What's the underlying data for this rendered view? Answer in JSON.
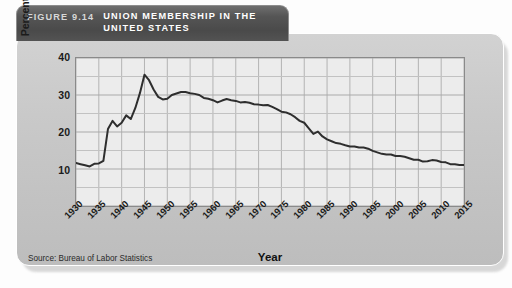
{
  "figure": {
    "number_label": "FIGURE 9.14",
    "title": "UNION MEMBERSHIP IN THE\nUNITED STATES",
    "source_note": "Source: Bureau of Labor Statistics"
  },
  "colors": {
    "panel": "#c9c9c9",
    "title_tab": "#4a4a4a",
    "title_text": "#ffffff",
    "plot_bg": "#ececec",
    "grid": "#b0b0b0",
    "line": "#2e2e2e",
    "axis": "#8a8a8a"
  },
  "chart_data": {
    "type": "line",
    "title": "UNION MEMBERSHIP IN THE UNITED STATES",
    "xlabel": "Year",
    "ylabel": "Percent of labor force",
    "xlim": [
      1930,
      2015
    ],
    "ylim": [
      0,
      40
    ],
    "yticks": [
      10,
      20,
      30,
      40
    ],
    "xticks": [
      1930,
      1935,
      1940,
      1945,
      1950,
      1955,
      1960,
      1965,
      1970,
      1975,
      1980,
      1985,
      1990,
      1995,
      2000,
      2005,
      2010,
      2015
    ],
    "grid": true,
    "legend": "none",
    "series": [
      {
        "name": "Union membership (percent of labor force)",
        "x": [
          1930,
          1931,
          1932,
          1933,
          1934,
          1935,
          1936,
          1937,
          1938,
          1939,
          1940,
          1941,
          1942,
          1943,
          1944,
          1945,
          1946,
          1947,
          1948,
          1949,
          1950,
          1951,
          1952,
          1953,
          1954,
          1955,
          1956,
          1957,
          1958,
          1959,
          1960,
          1961,
          1962,
          1963,
          1964,
          1965,
          1966,
          1967,
          1968,
          1969,
          1970,
          1971,
          1972,
          1973,
          1974,
          1975,
          1976,
          1977,
          1978,
          1979,
          1980,
          1981,
          1982,
          1983,
          1984,
          1985,
          1986,
          1987,
          1988,
          1989,
          1990,
          1991,
          1992,
          1993,
          1994,
          1995,
          1996,
          1997,
          1998,
          1999,
          2000,
          2001,
          2002,
          2003,
          2004,
          2005,
          2006,
          2007,
          2008,
          2009,
          2010,
          2011,
          2012,
          2013,
          2014,
          2015
        ],
        "values": [
          11.6,
          11.3,
          11.0,
          10.7,
          11.4,
          11.5,
          12.2,
          20.8,
          23.0,
          21.5,
          22.5,
          24.5,
          23.5,
          26.5,
          30.5,
          35.5,
          34.0,
          31.5,
          29.5,
          28.8,
          29.0,
          30.0,
          30.4,
          30.8,
          30.8,
          30.5,
          30.3,
          30.0,
          29.2,
          29.0,
          28.6,
          28.0,
          28.5,
          28.9,
          28.6,
          28.4,
          28.0,
          28.1,
          27.9,
          27.5,
          27.4,
          27.2,
          27.3,
          26.8,
          26.2,
          25.5,
          25.3,
          24.8,
          24.0,
          23.0,
          22.5,
          21.0,
          19.5,
          20.1,
          18.8,
          18.0,
          17.5,
          17.0,
          16.8,
          16.4,
          16.1,
          16.1,
          15.8,
          15.8,
          15.5,
          14.9,
          14.5,
          14.1,
          13.9,
          13.9,
          13.5,
          13.5,
          13.3,
          12.9,
          12.5,
          12.5,
          12.0,
          12.1,
          12.4,
          12.3,
          11.9,
          11.8,
          11.3,
          11.3,
          11.1,
          11.1
        ]
      }
    ]
  }
}
